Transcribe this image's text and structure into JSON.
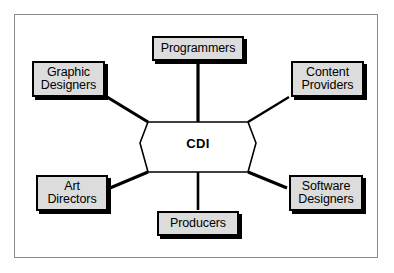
{
  "diagram": {
    "title": "CDI",
    "center": {
      "label": "CDI",
      "shape": "hexagon",
      "fill": "#ffffff",
      "stroke": "#000000"
    },
    "colors": {
      "node_fill": "#dcdcdc",
      "node_stroke": "#000000",
      "node_shadow": "#000000",
      "connector": "#000000",
      "frame_border": "#8a8a8a",
      "background": "#ffffff",
      "text": "#000000"
    },
    "nodes": [
      {
        "id": "programmers",
        "label": "Programmers",
        "lines": [
          "Programmers"
        ],
        "position": "top"
      },
      {
        "id": "graphic-designers",
        "label": "Graphic Designers",
        "lines": [
          "Graphic",
          "Designers"
        ],
        "position": "top-left"
      },
      {
        "id": "content-providers",
        "label": "Content Providers",
        "lines": [
          "Content",
          "Providers"
        ],
        "position": "top-right"
      },
      {
        "id": "art-directors",
        "label": "Art Directors",
        "lines": [
          "Art",
          "Directors"
        ],
        "position": "bottom-left"
      },
      {
        "id": "software-designers",
        "label": "Software Designers",
        "lines": [
          "Software",
          "Designers"
        ],
        "position": "bottom-right"
      },
      {
        "id": "producers",
        "label": "Producers",
        "lines": [
          "Producers"
        ],
        "position": "bottom"
      }
    ],
    "connectors": [
      {
        "from": "programmers",
        "to": "CDI"
      },
      {
        "from": "graphic-designers",
        "to": "CDI"
      },
      {
        "from": "content-providers",
        "to": "CDI"
      },
      {
        "from": "art-directors",
        "to": "CDI"
      },
      {
        "from": "software-designers",
        "to": "CDI"
      },
      {
        "from": "producers",
        "to": "CDI"
      }
    ]
  }
}
